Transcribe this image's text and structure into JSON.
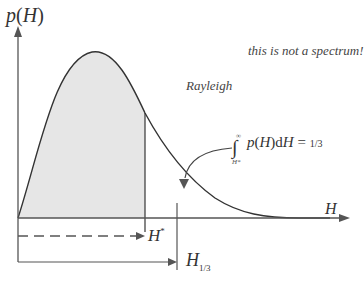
{
  "diagram": {
    "title": "",
    "type": "probability density curve",
    "y_axis_label": "p(H)",
    "x_axis_label": "H",
    "curve_label": "Rayleigh",
    "annotation": "this is not a spectrum!",
    "integral": {
      "lower_limit": "H*",
      "upper_limit": "∞",
      "expression": "p(H) dH",
      "equals": "= 1/3"
    },
    "markers": [
      {
        "name": "H*",
        "style": "dashed arrow"
      },
      {
        "name": "H1/3",
        "style": "solid arrow"
      }
    ],
    "colors": {
      "curve": "#333333",
      "shaded": "#e6e6e6",
      "axes": "#555555",
      "text": "#333333"
    }
  },
  "labels": {
    "p": "p",
    "H_in_p": "H",
    "note": "this is not a spectrum!",
    "rayleigh": "Rayleigh",
    "int_p": "p",
    "int_H": "H",
    "int_d": "d",
    "int_H2": "H",
    "int_eq": " = ",
    "int_frac": "1/3",
    "int_upper": "∞",
    "int_lower": "H*",
    "x_axis": "H",
    "hstar": "H",
    "hstar_sup": "*",
    "h13": "H",
    "h13_sub": "1/3"
  }
}
